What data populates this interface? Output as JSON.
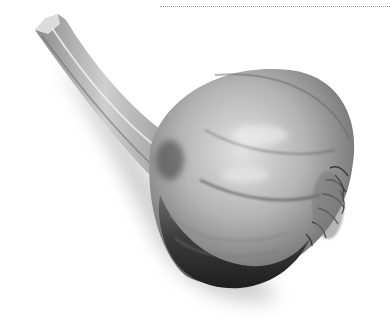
{
  "image": {
    "subject": "garlic bulb",
    "alt": "Whole garlic bulb with stem, grayscale photograph on white background",
    "colors": {
      "background": "#ffffff",
      "rule": "#9a9a9a",
      "bulb_light": "#d6d6d6",
      "bulb_mid": "#9c9c9c",
      "bulb_dark": "#2e2e2e"
    }
  }
}
